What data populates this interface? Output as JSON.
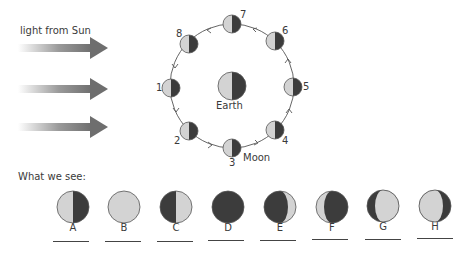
{
  "diagram": {
    "sun_label": "light from Sun",
    "earth_label": "Earth",
    "moon_label": "Moon",
    "section_label": "What we see:",
    "colors": {
      "lit": "#d3d3d3",
      "dark": "#3c3c3c",
      "outline": "#555555",
      "arrow": "#6e6e6e",
      "orbit": "#555555"
    },
    "orbit_positions": [
      {
        "number": "1",
        "side": "left"
      },
      {
        "number": "2",
        "side": "lower-left"
      },
      {
        "number": "3",
        "side": "bottom"
      },
      {
        "number": "4",
        "side": "lower-right"
      },
      {
        "number": "5",
        "side": "right"
      },
      {
        "number": "6",
        "side": "upper-right"
      },
      {
        "number": "7",
        "side": "top"
      },
      {
        "number": "8",
        "side": "upper-left"
      }
    ],
    "phases_seen": [
      {
        "letter": "A",
        "appearance": "left half lit, right half dark"
      },
      {
        "letter": "B",
        "appearance": "fully lit"
      },
      {
        "letter": "C",
        "appearance": "left half dark, right half lit"
      },
      {
        "letter": "D",
        "appearance": "fully dark"
      },
      {
        "letter": "E",
        "appearance": "thin crescent lit on right"
      },
      {
        "letter": "F",
        "appearance": "thin crescent lit on left"
      },
      {
        "letter": "G",
        "appearance": "gibbous lit, dark on left"
      },
      {
        "letter": "H",
        "appearance": "gibbous lit, dark on right"
      }
    ]
  }
}
